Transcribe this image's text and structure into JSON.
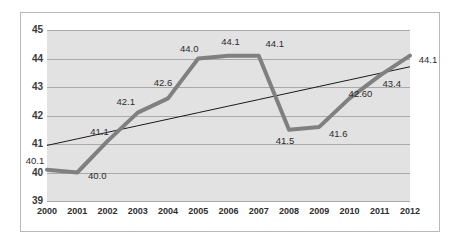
{
  "chart_data": {
    "type": "line",
    "title": "",
    "subtitle": "",
    "xlabel": "",
    "ylabel": "",
    "categories": [
      "2000",
      "2001",
      "2002",
      "2003",
      "2004",
      "2005",
      "2006",
      "2007",
      "2008",
      "2009",
      "2010",
      "2011",
      "2012"
    ],
    "xlim": [
      "2000",
      "2012"
    ],
    "ylim": [
      39,
      45
    ],
    "yticks": [
      "39",
      "40",
      "41",
      "42",
      "43",
      "44",
      "45"
    ],
    "grid": true,
    "legend": false,
    "legend_position": "none",
    "series": [
      {
        "name": "data-series",
        "color": "#808080",
        "line_width": 4,
        "values": [
          40.1,
          40.0,
          41.1,
          42.1,
          42.6,
          44.0,
          44.1,
          44.1,
          41.5,
          41.6,
          42.6,
          43.4,
          44.1
        ]
      },
      {
        "name": "trendline",
        "color": "#1a1a1a",
        "line_width": 1,
        "values": [
          40.95,
          41.18,
          41.41,
          41.64,
          41.87,
          42.1,
          42.33,
          42.56,
          42.79,
          43.02,
          43.25,
          43.48,
          43.71
        ]
      }
    ],
    "point_labels": [
      {
        "text": "40.1",
        "category": "2000",
        "value": 40.1
      },
      {
        "text": "40.0",
        "category": "2001",
        "value": 40.0
      },
      {
        "text": "41.1",
        "category": "2002",
        "value": 41.1
      },
      {
        "text": "42.1",
        "category": "2003",
        "value": 42.1
      },
      {
        "text": "42.6",
        "category": "2004",
        "value": 42.6
      },
      {
        "text": "44.0",
        "category": "2005",
        "value": 44.0
      },
      {
        "text": "44.1",
        "category": "2006",
        "value": 44.1
      },
      {
        "text": "44.1",
        "category": "2007",
        "value": 44.1
      },
      {
        "text": "41.5",
        "category": "2008",
        "value": 41.5
      },
      {
        "text": "41.6",
        "category": "2009",
        "value": 41.6
      },
      {
        "text": "42.60",
        "category": "2010",
        "value": 42.6
      },
      {
        "text": "43.4",
        "category": "2011",
        "value": 43.4
      },
      {
        "text": "44.1",
        "category": "2012",
        "value": 44.1
      }
    ],
    "colors": {
      "plot_background": "#e2e2e2",
      "gridline": "#a9a9a9",
      "series_line": "#808080",
      "trendline": "#1a1a1a",
      "frame_border": "#b9b9b9",
      "tick_text": "#2e2e2e"
    }
  }
}
